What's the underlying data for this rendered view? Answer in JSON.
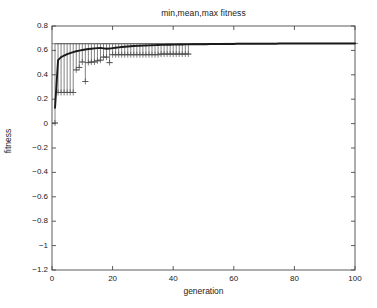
{
  "figure": {
    "title": "min,mean,max fitness",
    "background_color": "#ffffff",
    "plot_line_color": "#1a1a1a",
    "errorbar_color": "#4d4d4d"
  },
  "axes": {
    "xlabel": "generation",
    "ylabel": "fitness",
    "xlim": [
      0,
      100
    ],
    "ylim": [
      -1.2,
      0.8
    ],
    "xticks": [
      0,
      20,
      40,
      60,
      80,
      100
    ],
    "xtick_labels": [
      "0",
      "20",
      "40",
      "60",
      "80",
      "100"
    ],
    "yticks": [
      -1.2,
      -1,
      -0.8,
      -0.6,
      -0.4,
      -0.2,
      0,
      0.2,
      0.4,
      0.6,
      0.8
    ],
    "ytick_labels": [
      "-1.2",
      "-1",
      "-0.8",
      "-0.6",
      "-0.4",
      "-0.2",
      "0",
      "0.2",
      "0.4",
      "0.6",
      "0.8"
    ],
    "grid": false,
    "box": true
  },
  "chart_data": {
    "type": "line",
    "title": "min,mean,max fitness",
    "xlabel": "generation",
    "ylabel": "fitness",
    "xlim": [
      0,
      100
    ],
    "ylim": [
      -1.2,
      0.8
    ],
    "legend": null,
    "x": [
      1,
      2,
      3,
      4,
      5,
      6,
      7,
      8,
      9,
      10,
      11,
      12,
      13,
      14,
      15,
      16,
      17,
      18,
      19,
      20,
      21,
      22,
      23,
      24,
      25,
      26,
      27,
      28,
      29,
      30,
      31,
      32,
      33,
      34,
      35,
      36,
      37,
      38,
      39,
      40,
      41,
      42,
      43,
      44,
      45,
      46,
      47,
      48,
      49,
      50,
      51,
      52,
      53,
      54,
      55,
      56,
      57,
      58,
      59,
      60,
      61,
      62,
      63,
      64,
      65,
      66,
      67,
      68,
      69,
      70,
      71,
      72,
      73,
      74,
      75,
      76,
      77,
      78,
      79,
      80,
      81,
      82,
      83,
      84,
      85,
      86,
      87,
      88,
      89,
      90,
      91,
      92,
      93,
      94,
      95,
      96,
      97,
      98,
      99,
      100
    ],
    "series": [
      {
        "name": "mean",
        "style": "thick-line",
        "values": [
          0.13,
          0.52,
          0.545,
          0.558,
          0.569,
          0.578,
          0.586,
          0.593,
          0.598,
          0.603,
          0.607,
          0.611,
          0.614,
          0.617,
          0.619,
          0.621,
          0.617,
          0.613,
          0.615,
          0.619,
          0.622,
          0.625,
          0.628,
          0.63,
          0.632,
          0.634,
          0.636,
          0.637,
          0.638,
          0.639,
          0.64,
          0.641,
          0.642,
          0.643,
          0.644,
          0.645,
          0.645,
          0.646,
          0.646,
          0.647,
          0.647,
          0.648,
          0.648,
          0.649,
          0.649,
          0.65,
          0.65,
          0.65,
          0.651,
          0.651,
          0.651,
          0.652,
          0.652,
          0.652,
          0.652,
          0.653,
          0.653,
          0.653,
          0.653,
          0.653,
          0.654,
          0.654,
          0.654,
          0.654,
          0.654,
          0.654,
          0.655,
          0.655,
          0.655,
          0.655,
          0.655,
          0.655,
          0.655,
          0.655,
          0.656,
          0.656,
          0.656,
          0.656,
          0.656,
          0.656,
          0.656,
          0.656,
          0.656,
          0.656,
          0.657,
          0.657,
          0.657,
          0.657,
          0.657,
          0.657,
          0.657,
          0.657,
          0.657,
          0.657,
          0.657,
          0.657,
          0.657,
          0.657,
          0.657,
          0.657
        ]
      },
      {
        "name": "max",
        "style": "errorbar-upper-cap",
        "values": [
          0.655,
          0.655,
          0.655,
          0.655,
          0.655,
          0.655,
          0.655,
          0.655,
          0.655,
          0.655,
          0.655,
          0.655,
          0.655,
          0.655,
          0.655,
          0.655,
          0.655,
          0.655,
          0.655,
          0.655,
          0.655,
          0.655,
          0.655,
          0.655,
          0.655,
          0.655,
          0.655,
          0.655,
          0.655,
          0.655,
          0.655,
          0.655,
          0.655,
          0.655,
          0.655,
          0.655,
          0.655,
          0.655,
          0.655,
          0.655,
          0.655,
          0.655,
          0.655,
          0.655,
          0.655,
          0.655,
          0.656,
          0.656,
          0.656,
          0.656,
          0.656,
          0.656,
          0.656,
          0.656,
          0.656,
          0.656,
          0.657,
          0.657,
          0.657,
          0.657,
          0.657,
          0.657,
          0.657,
          0.657,
          0.657,
          0.657,
          0.657,
          0.657,
          0.657,
          0.657,
          0.657,
          0.657,
          0.657,
          0.657,
          0.657,
          0.657,
          0.657,
          0.657,
          0.657,
          0.657,
          0.657,
          0.657,
          0.657,
          0.657,
          0.657,
          0.657,
          0.657,
          0.657,
          0.657,
          0.657,
          0.657,
          0.657,
          0.657,
          0.657,
          0.657,
          0.657,
          0.657,
          0.657,
          0.657,
          0.657
        ]
      },
      {
        "name": "min",
        "style": "errorbar-lower-cap",
        "values": [
          0.005,
          0.255,
          0.255,
          0.255,
          0.255,
          0.255,
          0.255,
          0.44,
          0.46,
          0.505,
          0.345,
          0.5,
          0.505,
          0.505,
          0.515,
          0.52,
          0.545,
          0.545,
          0.5,
          0.565,
          0.565,
          0.565,
          0.565,
          0.565,
          0.565,
          0.565,
          0.565,
          0.565,
          0.565,
          0.565,
          0.565,
          0.565,
          0.565,
          0.565,
          0.565,
          0.57,
          0.57,
          0.57,
          0.57,
          0.57,
          0.57,
          0.57,
          0.57,
          0.57,
          0.57,
          null,
          null,
          null,
          null,
          null,
          null,
          null,
          null,
          null,
          null,
          null,
          null,
          null,
          null,
          null,
          null,
          null,
          null,
          null,
          null,
          null,
          null,
          null,
          null,
          null,
          null,
          null,
          null,
          null,
          null,
          null,
          null,
          null,
          null,
          null,
          null,
          null,
          null,
          null,
          null,
          null,
          null,
          null,
          null,
          null,
          null,
          null,
          null,
          null,
          null,
          null,
          null,
          null,
          null,
          null
        ]
      }
    ]
  }
}
